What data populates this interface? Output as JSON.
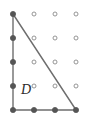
{
  "figure": {
    "region_label": "D",
    "colors": {
      "background": "#ffffff",
      "edge_stroke": "#6e6e6e",
      "filled_point": "#555555",
      "open_point_stroke": "#8a8a8a",
      "open_point_fill": "#ffffff",
      "label_color": "#2b2b2b"
    },
    "geometry": {
      "width": 92,
      "height": 131,
      "grid_origin_x": 13,
      "grid_origin_y": 14,
      "grid_step_x": 21,
      "grid_step_y": 24,
      "grid_cols": 4,
      "grid_rows": 5,
      "filled_radius": 2.6,
      "open_radius": 2.0,
      "edge_width": 1.4
    },
    "label_position": {
      "x": 21,
      "y": 94
    },
    "edges": [
      {
        "name": "left-vertical-edge",
        "x1": 13,
        "y1": 14,
        "x2": 13,
        "y2": 110
      },
      {
        "name": "bottom-horizontal-edge",
        "x1": 13,
        "y1": 110,
        "x2": 76,
        "y2": 110
      },
      {
        "name": "hypotenuse-edge",
        "x1": 13,
        "y1": 14,
        "x2": 76,
        "y2": 110
      }
    ],
    "lattice_points": [
      {
        "col": 0,
        "row": 0,
        "x": 13,
        "y": 14,
        "filled": true
      },
      {
        "col": 1,
        "row": 0,
        "x": 34,
        "y": 14,
        "filled": false
      },
      {
        "col": 2,
        "row": 0,
        "x": 55,
        "y": 14,
        "filled": false
      },
      {
        "col": 3,
        "row": 0,
        "x": 76,
        "y": 14,
        "filled": false
      },
      {
        "col": 0,
        "row": 1,
        "x": 13,
        "y": 38,
        "filled": true
      },
      {
        "col": 1,
        "row": 1,
        "x": 34,
        "y": 38,
        "filled": false
      },
      {
        "col": 2,
        "row": 1,
        "x": 55,
        "y": 38,
        "filled": false
      },
      {
        "col": 3,
        "row": 1,
        "x": 76,
        "y": 38,
        "filled": false
      },
      {
        "col": 0,
        "row": 2,
        "x": 13,
        "y": 62,
        "filled": true
      },
      {
        "col": 1,
        "row": 2,
        "x": 34,
        "y": 62,
        "filled": false
      },
      {
        "col": 2,
        "row": 2,
        "x": 55,
        "y": 62,
        "filled": false
      },
      {
        "col": 3,
        "row": 2,
        "x": 76,
        "y": 62,
        "filled": false
      },
      {
        "col": 0,
        "row": 3,
        "x": 13,
        "y": 86,
        "filled": true
      },
      {
        "col": 1,
        "row": 3,
        "x": 34,
        "y": 86,
        "filled": false
      },
      {
        "col": 2,
        "row": 3,
        "x": 55,
        "y": 86,
        "filled": false
      },
      {
        "col": 3,
        "row": 3,
        "x": 76,
        "y": 86,
        "filled": false
      },
      {
        "col": 0,
        "row": 4,
        "x": 13,
        "y": 110,
        "filled": true
      },
      {
        "col": 1,
        "row": 4,
        "x": 34,
        "y": 110,
        "filled": true
      },
      {
        "col": 2,
        "row": 4,
        "x": 55,
        "y": 110,
        "filled": true
      },
      {
        "col": 3,
        "row": 4,
        "x": 76,
        "y": 110,
        "filled": true
      }
    ]
  }
}
